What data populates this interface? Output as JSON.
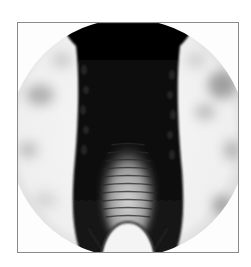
{
  "figure": {
    "kind": "grayscale shadowgraph photograph",
    "frame_border_color": "#8a8a8a",
    "background_color": "#ffffff",
    "field_shape": "circle",
    "colors": {
      "dark": "#0d0d0d",
      "mid": "#5a5a5a",
      "light": "#f2f2f2"
    }
  }
}
